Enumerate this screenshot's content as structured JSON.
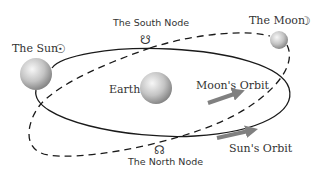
{
  "diagram": {
    "labels": {
      "sun": "The Sun",
      "sun_symbol": "☉",
      "moon": "The Moon",
      "moon_symbol": "☽",
      "earth": "Earth",
      "south_node": "The South Node",
      "south_node_symbol": "☋",
      "north_node": "The North Node",
      "north_node_symbol": "☊",
      "moons_orbit": "Moon's Orbit",
      "suns_orbit": "Sun's Orbit"
    },
    "bodies": [
      {
        "name": "sun",
        "cx": 36,
        "cy": 74,
        "r": 16
      },
      {
        "name": "earth",
        "cx": 156,
        "cy": 88,
        "r": 16
      },
      {
        "name": "moon",
        "cx": 279,
        "cy": 40,
        "r": 9
      }
    ],
    "colors": {
      "orbit_line": "#1a1a1a",
      "arrow": "#808080",
      "sphere_light": "#f4f4f4",
      "sphere_dark": "#8c8c8c",
      "text": "#333333"
    }
  }
}
